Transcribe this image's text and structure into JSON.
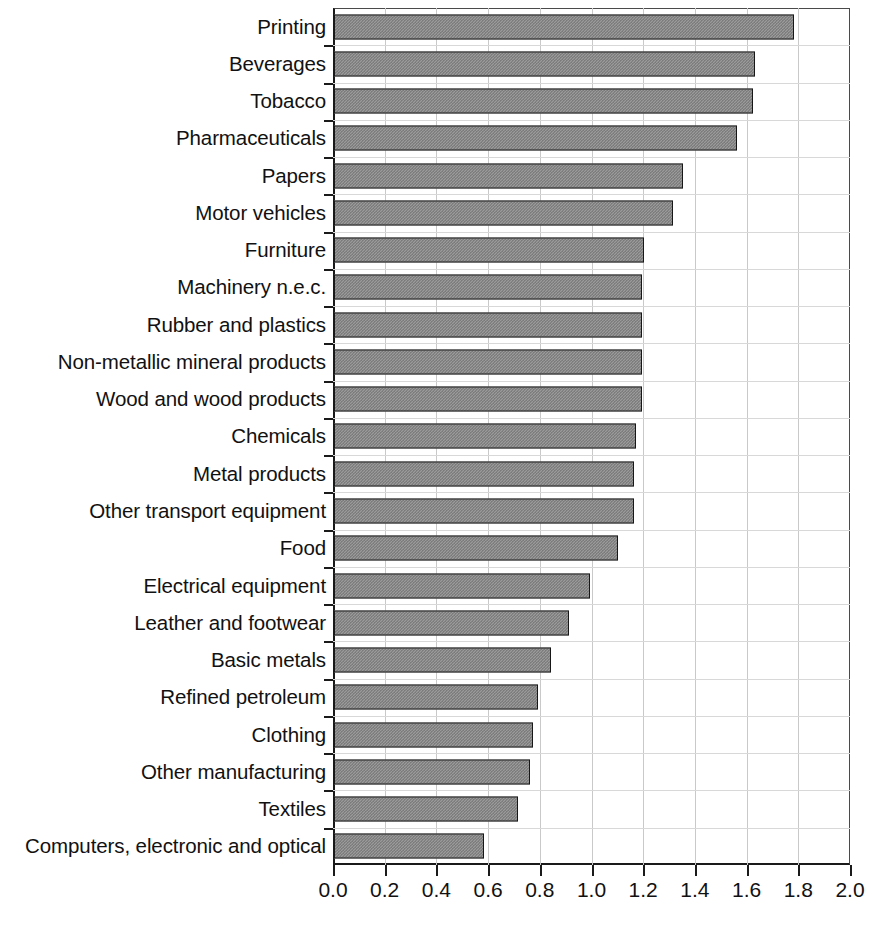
{
  "chart_data": {
    "type": "bar",
    "orientation": "horizontal",
    "title": "",
    "subtitle": "",
    "xlabel": "",
    "ylabel": "",
    "xlim": [
      0.0,
      2.0
    ],
    "xticks": [
      "0.0",
      "0.2",
      "0.4",
      "0.6",
      "0.8",
      "1.0",
      "1.2",
      "1.4",
      "1.6",
      "1.8",
      "2.0"
    ],
    "xtick_values": [
      0.0,
      0.2,
      0.4,
      0.6,
      0.8,
      1.0,
      1.2,
      1.4,
      1.6,
      1.8,
      2.0
    ],
    "grid": "both",
    "legend": "none",
    "bar_fill": "#9b9b9b",
    "bar_hatch_color": "#6f6f6f",
    "bar_edge": "#171717",
    "axis_color": "#1a1a1a",
    "grid_color": "#c9c9c9",
    "background": "#ffffff",
    "categories": [
      "Printing",
      "Beverages",
      "Tobacco",
      "Pharmaceuticals",
      "Papers",
      "Motor vehicles",
      "Furniture",
      "Machinery n.e.c.",
      "Rubber and plastics",
      "Non-metallic mineral products",
      "Wood and wood products",
      "Chemicals",
      "Metal products",
      "Other transport equipment",
      "Food",
      "Electrical equipment",
      "Leather and footwear",
      "Basic metals",
      "Refined petroleum",
      "Clothing",
      "Other manufacturing",
      "Textiles",
      "Computers, electronic and optical"
    ],
    "values": [
      1.78,
      1.63,
      1.62,
      1.56,
      1.35,
      1.31,
      1.2,
      1.19,
      1.19,
      1.19,
      1.19,
      1.17,
      1.16,
      1.16,
      1.1,
      0.99,
      0.91,
      0.84,
      0.79,
      0.77,
      0.76,
      0.71,
      0.58
    ]
  }
}
